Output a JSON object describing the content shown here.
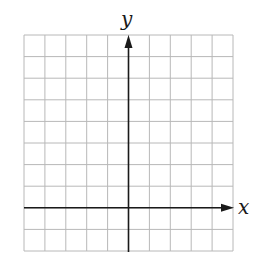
{
  "diagram": {
    "type": "coordinate-grid",
    "x_axis_label": "x",
    "y_axis_label": "y",
    "grid": {
      "columns": 10,
      "rows": 10,
      "left": 24,
      "top": 35,
      "right": 233,
      "bottom": 251,
      "line_color": "#b8b8b8"
    },
    "origin": {
      "column_index": 5,
      "row_index": 8
    },
    "axis_color": "#1a1a1a"
  }
}
